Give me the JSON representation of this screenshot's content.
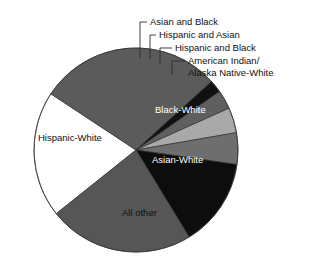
{
  "chart_data": {
    "type": "pie",
    "title": "",
    "subtitle": "",
    "xlabel": "",
    "ylabel": "",
    "legend_position": "none",
    "grid": false,
    "label_style": "callouts-and-inline",
    "categories": [
      "All other",
      "Hispanic-White",
      "Asian and Black",
      "Hispanic and Asian",
      "Hispanic and Black",
      "American Indian/Alaska Native-White",
      "Black-White",
      "Asian-White"
    ],
    "values": [
      20,
      29,
      2,
      3,
      4,
      5,
      14,
      23
    ],
    "colors": [
      "#ffffff",
      "#5b5b5b",
      "#111111",
      "#5f5f5f",
      "#a9a9a9",
      "#6e6e6e",
      "#0d0d0d",
      "#565656"
    ],
    "slices": [
      {
        "label": "All other",
        "value": 20,
        "color": "#ffffff",
        "text_color": "dark",
        "placement": "inline"
      },
      {
        "label": "Hispanic-White",
        "value": 29,
        "color": "#5b5b5b",
        "text_color": "dark",
        "placement": "inline"
      },
      {
        "label": "Asian and Black",
        "value": 2,
        "color": "#111111",
        "text_color": "dark",
        "placement": "callout"
      },
      {
        "label": "Hispanic and Asian",
        "value": 3,
        "color": "#5f5f5f",
        "text_color": "dark",
        "placement": "callout"
      },
      {
        "label": "Hispanic and Black",
        "value": 4,
        "color": "#a9a9a9",
        "text_color": "dark",
        "placement": "callout"
      },
      {
        "label": "American Indian/Alaska Native-White",
        "value": 5,
        "color": "#6e6e6e",
        "text_color": "dark",
        "placement": "callout"
      },
      {
        "label": "Black-White",
        "value": 14,
        "color": "#0d0d0d",
        "text_color": "light",
        "placement": "inline"
      },
      {
        "label": "Asian-White",
        "value": 23,
        "color": "#565656",
        "text_color": "light",
        "placement": "inline"
      }
    ]
  },
  "callouts": {
    "asian_and_black": "Asian and Black",
    "hispanic_and_asian": "Hispanic and Asian",
    "hispanic_and_black": "Hispanic and Black",
    "american_indian_line1": "American Indian/",
    "american_indian_line2": "Alaska Native-White"
  },
  "inline_labels": {
    "black_white": "Black-White",
    "asian_white": "Asian-White",
    "hispanic_white": "Hispanic-White",
    "all_other": "All other"
  }
}
